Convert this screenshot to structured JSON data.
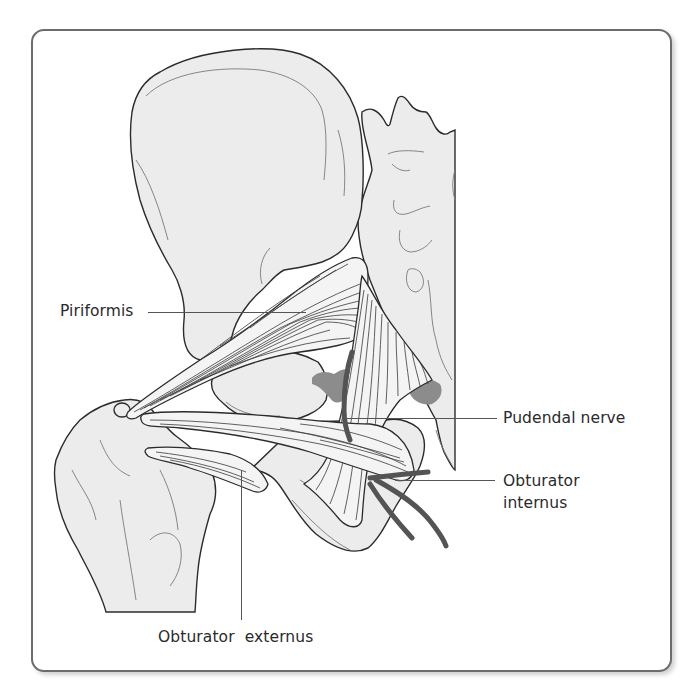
{
  "figure": {
    "type": "anatomical-illustration",
    "colors": {
      "frame_border": "#6c6c6c",
      "bone_fill": "#ececec",
      "outline": "#2b2b2b",
      "ligament_shadow": "#8c8c8c",
      "nerve": "#545454",
      "label_text": "#2a2a2a"
    }
  },
  "labels": {
    "piriformis": "Piriformis",
    "pudendal_nerve": "Pudendal nerve",
    "obturator_internus_line1": "Obturator",
    "obturator_internus_line2": "internus",
    "obturator_externus": "Obturator  externus"
  }
}
